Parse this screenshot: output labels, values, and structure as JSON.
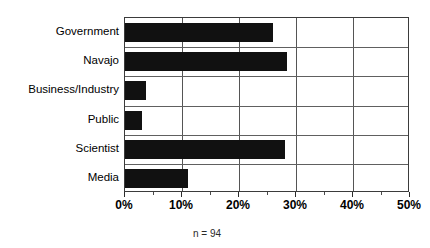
{
  "chart_data": {
    "type": "bar",
    "orientation": "horizontal",
    "title": "",
    "xlabel": "",
    "ylabel": "",
    "categories": [
      "Government",
      "Navajo",
      "Business/Industry",
      "Public",
      "Scientist",
      "Media"
    ],
    "values": [
      26,
      28.5,
      3.7,
      3,
      28,
      11
    ],
    "value_unit": "%",
    "xlim": [
      0,
      50
    ],
    "xticks": [
      0,
      10,
      20,
      30,
      40,
      50
    ],
    "xticklabels": [
      "0%",
      "10%",
      "20%",
      "30%",
      "40%",
      "50%"
    ],
    "minor_tick_step": 5,
    "grid": "vertical-and-horizontal",
    "legend": "none",
    "bar_color": "#111111",
    "annotations": [
      "n = 94"
    ]
  },
  "footnote": "n = 94"
}
